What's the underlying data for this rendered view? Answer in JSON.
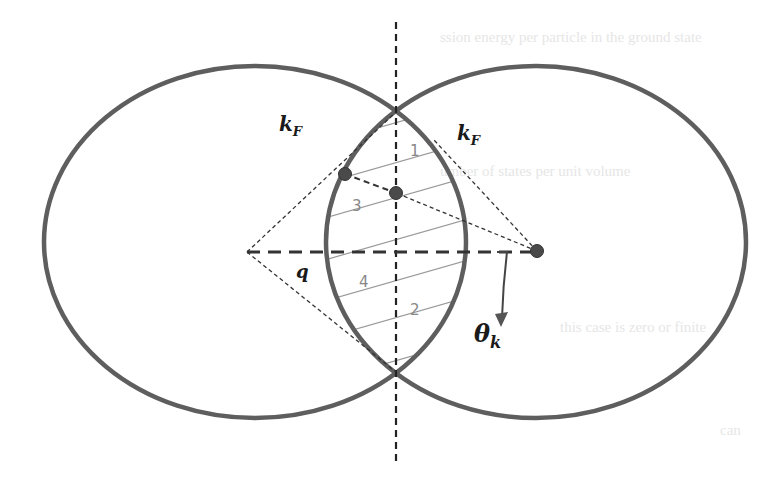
{
  "diagram": {
    "type": "fermi-sphere-overlap",
    "colors": {
      "circle": "#5e5e5e",
      "dashed": "#333333",
      "hatch": "#9a9a9a",
      "dot": "#4a4a4a",
      "region_label": "#888888",
      "math_label": "#1a1a1a",
      "background": "#ffffff",
      "faint_text": "#e6e6e6"
    },
    "circles": [
      {
        "name": "left-fermi-sphere",
        "cx": 255,
        "cy": 242,
        "rx": 211,
        "ry": 176
      },
      {
        "name": "right-fermi-sphere",
        "cx": 536,
        "cy": 242,
        "rx": 210,
        "ry": 176
      }
    ],
    "labels": {
      "kF_left": "k",
      "kF_left_sub": "F",
      "kF_right": "k",
      "kF_right_sub": "F",
      "q": "q",
      "theta": "θ",
      "theta_sub": "k",
      "region1": "1",
      "region2": "2",
      "region3": "3",
      "region4": "4"
    },
    "bleed_through_text": [
      "ssion energy per particle in the ground state",
      "umber of states per unit volume",
      "this case is zero or finite",
      "can"
    ]
  }
}
